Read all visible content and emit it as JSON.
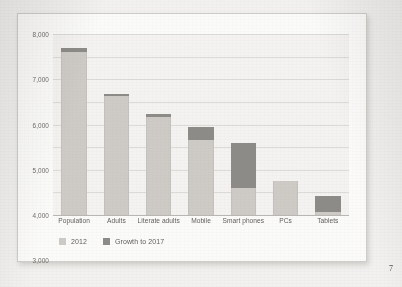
{
  "page": {
    "page_number": "7"
  },
  "chart_data": {
    "type": "bar",
    "subtype": "stacked",
    "title": "",
    "subtitle": "",
    "xlabel": "",
    "ylabel": "",
    "ylim": [
      0,
      8000
    ],
    "ytick_labels": [
      "0",
      "1,000",
      "2,000",
      "3,000",
      "4,000",
      "5,000",
      "6,000",
      "7,000",
      "8,000"
    ],
    "ytick_values": [
      0,
      1000,
      2000,
      3000,
      4000,
      5000,
      6000,
      7000,
      8000
    ],
    "grid": true,
    "legend_position": "bottom-left",
    "categories": [
      "Population",
      "Adults",
      "Literate adults",
      "Mobile",
      "Smart phones",
      "PCs",
      "Tablets"
    ],
    "series": [
      {
        "name": "2012",
        "color": "#cecbc7",
        "values": [
          7200,
          5250,
          4350,
          3300,
          1200,
          1500,
          150
        ]
      },
      {
        "name": "Growth to 2017",
        "color": "#8d8b88",
        "values": [
          200,
          100,
          100,
          600,
          2000,
          0,
          700
        ]
      }
    ],
    "totals": [
      7400,
      5350,
      4450,
      3900,
      3200,
      1500,
      850
    ],
    "legend": [
      {
        "label": "2012",
        "color": "#cecbc7"
      },
      {
        "label": "Growth to 2017",
        "color": "#8d8b88"
      }
    ]
  },
  "colors": {
    "series_base": "#cecbc7",
    "series_growth": "#8d8b88",
    "plot_background": "#f4f3f1",
    "gridline": "#dddbd7",
    "card_background": "#fbfbfa",
    "page_background": "#f2f1ef",
    "text": "#5f5d5a"
  }
}
